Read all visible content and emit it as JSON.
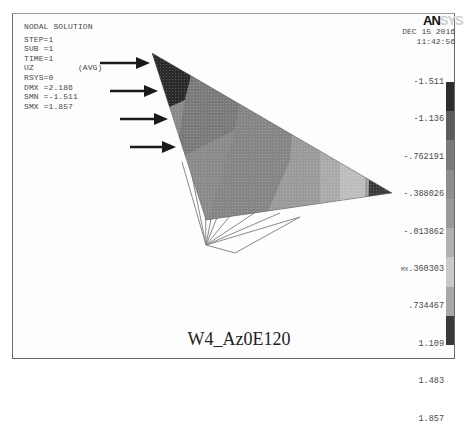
{
  "window": {
    "type": "ANSYS nodal solution contour plot"
  },
  "info_block": {
    "title": "NODAL SOLUTION",
    "lines": [
      "STEP=1",
      "SUB =1",
      "TIME=1",
      "UZ         (AVG)",
      "RSYS=0",
      "DMX =2.186",
      "SMN =-1.511",
      "SMX =1.857"
    ]
  },
  "logo": {
    "text_dark": "AN",
    "text_faded": "SYS"
  },
  "timestamp": {
    "date": "DEC 15 2016",
    "time": "11:42:56"
  },
  "legend": {
    "labels": [
      "-1.511",
      "-1.136",
      "-.762191",
      "-.388026",
      "-.013862",
      ".360303",
      ".734467",
      "1.109",
      "1.483",
      "1.857"
    ],
    "mx_marker": "MX",
    "colors": [
      "#2e2e2e",
      "#5c5c5c",
      "#7a7a7a",
      "#8e8e8e",
      "#9a9a9a",
      "#b0b0b0",
      "#c8c8c8",
      "#a8a8a8",
      "#3a3a3a"
    ]
  },
  "arrows": {
    "count": 4,
    "color": "#1a1a1a"
  },
  "caption": "W4_Az0E120"
}
